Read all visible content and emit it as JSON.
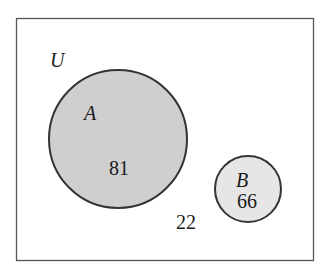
{
  "diagram": {
    "type": "venn",
    "universe_label": "U",
    "sets": [
      {
        "label": "A",
        "value": "81",
        "fill": "#cfcfcf"
      },
      {
        "label": "B",
        "value": "66",
        "fill": "#e6e6e6"
      }
    ],
    "outside_value": "22",
    "colors": {
      "stroke": "#333333",
      "border": "#555555",
      "background": "#ffffff"
    }
  }
}
